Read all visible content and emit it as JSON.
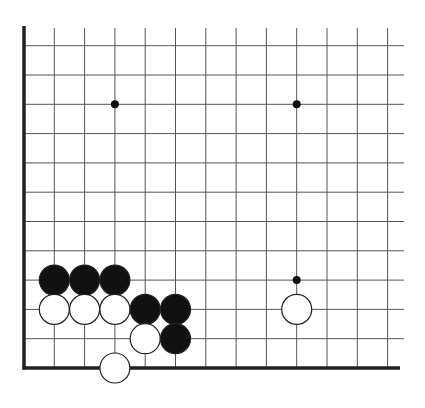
{
  "diagram": {
    "type": "go-board",
    "view": "lower-left corner, partial board",
    "colors": {
      "background": "#ffffff",
      "grid_line": "#555555",
      "edge_line": "#222222",
      "black_stone": "#111111",
      "white_stone": "#ffffff",
      "stone_outline": "#222222",
      "star_point": "#111111"
    },
    "grid": {
      "columns": 13,
      "rows": 12,
      "origin_x": 24,
      "col_spacing": 30.3,
      "bottom_y": 368,
      "row_spacing": 29.3,
      "top_extend_y": 28,
      "right_extend_x": 404,
      "left_edge": true,
      "bottom_edge": true
    },
    "star_points": [
      {
        "col": 3,
        "row": 9
      },
      {
        "col": 9,
        "row": 9
      },
      {
        "col": 9,
        "row": 3
      }
    ],
    "stones": [
      {
        "color": "black",
        "col": 1,
        "row": 3
      },
      {
        "color": "black",
        "col": 2,
        "row": 3
      },
      {
        "color": "black",
        "col": 3,
        "row": 3
      },
      {
        "color": "white",
        "col": 1,
        "row": 2
      },
      {
        "color": "white",
        "col": 2,
        "row": 2
      },
      {
        "color": "white",
        "col": 3,
        "row": 2
      },
      {
        "color": "black",
        "col": 4,
        "row": 2
      },
      {
        "color": "black",
        "col": 5,
        "row": 2
      },
      {
        "color": "white",
        "col": 4,
        "row": 1
      },
      {
        "color": "black",
        "col": 5,
        "row": 1
      },
      {
        "color": "white",
        "col": 3,
        "row": 0
      },
      {
        "color": "white",
        "col": 9,
        "row": 2
      }
    ],
    "stone_radius": 15
  }
}
